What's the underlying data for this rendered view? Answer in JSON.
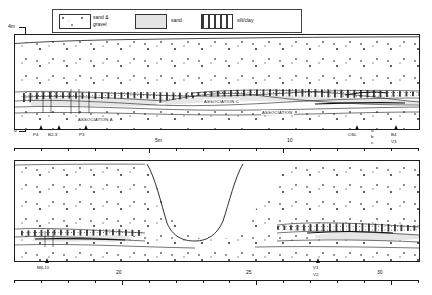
{
  "figure": {
    "type": "geological-cross-section",
    "panels": 2
  },
  "legend": {
    "items": [
      {
        "id": "sand-gravel",
        "label_line1": "sand &",
        "label_line2": "gravel",
        "pattern": "gravel-clasts"
      },
      {
        "id": "sand",
        "label_line1": "sand",
        "label_line2": "",
        "pattern": "stipple"
      },
      {
        "id": "silt-clay",
        "label_line1": "silt/clay",
        "label_line2": "",
        "pattern": "dash-dot"
      }
    ]
  },
  "vertical_axis": {
    "top_label": "4m",
    "bottom_label": "0",
    "unit": "m"
  },
  "upper_panel": {
    "associations": [
      {
        "label": "ASSOCIATION C"
      },
      {
        "label": "ASSOCIATION"
      },
      {
        "label": "ASSOCIATION A"
      }
    ],
    "markers": [
      {
        "label": "P4"
      },
      {
        "label": "B2-3"
      },
      {
        "label": "P3"
      },
      {
        "label": "OSL"
      },
      {
        "label": "B4",
        "sub": "V3"
      }
    ],
    "osl_sublabels": [
      "a",
      "b",
      "c"
    ],
    "scale": {
      "ticks": [
        {
          "pos": 0,
          "label": ""
        },
        {
          "pos": 1,
          "label": ""
        },
        {
          "pos": 2,
          "label": ""
        },
        {
          "pos": 3,
          "label": ""
        },
        {
          "pos": 4,
          "label": ""
        },
        {
          "pos": 5,
          "label": "5m"
        },
        {
          "pos": 6,
          "label": ""
        },
        {
          "pos": 7,
          "label": ""
        },
        {
          "pos": 8,
          "label": ""
        },
        {
          "pos": 9,
          "label": ""
        },
        {
          "pos": 10,
          "label": "10"
        },
        {
          "pos": 11,
          "label": ""
        },
        {
          "pos": 12,
          "label": ""
        },
        {
          "pos": 13,
          "label": ""
        },
        {
          "pos": 14,
          "label": ""
        },
        {
          "pos": 15,
          "label": ""
        }
      ]
    }
  },
  "lower_panel": {
    "markers": [
      {
        "label": "M6-11"
      },
      {
        "label": "V1",
        "sub": "V2"
      }
    ],
    "scale": {
      "ticks": [
        {
          "pos": 16,
          "label": ""
        },
        {
          "pos": 17,
          "label": ""
        },
        {
          "pos": 18,
          "label": ""
        },
        {
          "pos": 19,
          "label": ""
        },
        {
          "pos": 20,
          "label": "20"
        },
        {
          "pos": 21,
          "label": ""
        },
        {
          "pos": 22,
          "label": ""
        },
        {
          "pos": 23,
          "label": ""
        },
        {
          "pos": 24,
          "label": ""
        },
        {
          "pos": 25,
          "label": "25"
        },
        {
          "pos": 26,
          "label": ""
        },
        {
          "pos": 27,
          "label": ""
        },
        {
          "pos": 28,
          "label": ""
        },
        {
          "pos": 29,
          "label": ""
        },
        {
          "pos": 30,
          "label": "30"
        },
        {
          "pos": 31,
          "label": ""
        }
      ]
    }
  },
  "colors": {
    "line": "#1a1a1a",
    "gravel_fill": "#ffffff",
    "sand_fill": "#e6e6e6",
    "silt_fill": "#ffffff",
    "background": "#ffffff"
  }
}
